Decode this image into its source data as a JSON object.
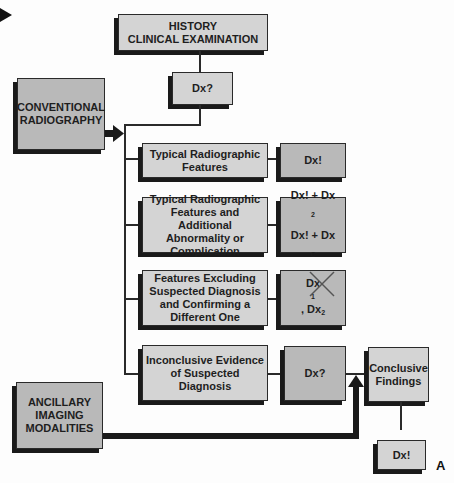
{
  "figure_label": "A",
  "colors": {
    "light_box": "#d4d4d4",
    "dark_box": "#b9b9b9",
    "line": "#2a2a2a"
  },
  "start": {
    "line1": "HISTORY",
    "line2": "CLINICAL EXAMINATION"
  },
  "initial_dx": "Dx?",
  "conventional": {
    "line1": "CONVENTIONAL",
    "line2": "RADIOGRAPHY"
  },
  "ancillary": {
    "line1": "ANCILLARY",
    "line2": "IMAGING",
    "line3": "MODALITIES"
  },
  "branches": [
    {
      "lines": [
        "Typical Radiographic",
        "Features"
      ],
      "result": {
        "text": "Dx!"
      }
    },
    {
      "lines": [
        "Typical Radiographic",
        "Features and Additional",
        "Abnormality or",
        "Complication"
      ],
      "result": {
        "row1_main": "Dx! + Dx",
        "row1_sub": "2",
        "row2_main": "Dx! + Dx",
        "row2_sub": "C"
      }
    },
    {
      "lines": [
        "Features Excluding",
        "Suspected Diagnosis",
        "and Confirming a",
        "Different One"
      ],
      "result": {
        "crossed": "Dx",
        "crossed_sub": "1",
        "sep": ", ",
        "main": "Dx",
        "sub": "2"
      }
    },
    {
      "lines": [
        "Inconclusive Evidence",
        "of Suspected Diagnosis"
      ],
      "result": {
        "text": "Dx?"
      }
    }
  ],
  "conclusive": {
    "line1": "Conclusive",
    "line2": "Findings"
  },
  "final_dx": "Dx!"
}
